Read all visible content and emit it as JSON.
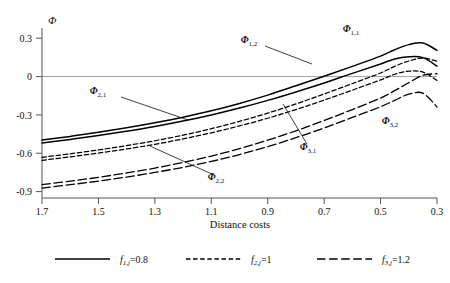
{
  "chart_data": {
    "type": "line",
    "title": "",
    "xlabel": "Distance costs",
    "ylabel": "Φ",
    "xlim": [
      1.7,
      0.3
    ],
    "ylim": [
      -0.95,
      0.38
    ],
    "x_reversed": true,
    "grid": false,
    "zero_line": true,
    "xticks": [
      "1.7",
      "1.5",
      "1.3",
      "1.1",
      "0.9",
      "0.7",
      "0.5",
      "0.3"
    ],
    "xtick_values": [
      1.7,
      1.5,
      1.3,
      1.1,
      0.9,
      0.7,
      0.5,
      0.3
    ],
    "yticks": [
      "0.3",
      "0",
      "-0.3",
      "-0.6",
      "-0.9"
    ],
    "ytick_values": [
      0.3,
      0,
      -0.3,
      -0.6,
      -0.9
    ],
    "legend_position": "below",
    "x": [
      1.7,
      1.6,
      1.5,
      1.4,
      1.3,
      1.2,
      1.1,
      1.0,
      0.9,
      0.8,
      0.7,
      0.6,
      0.5,
      0.45,
      0.4,
      0.35,
      0.3
    ],
    "series": [
      {
        "name": "Φ 1,1",
        "label": "Φ",
        "sub": "1,1",
        "style": "solid",
        "group": "f1j",
        "values": [
          -0.497,
          -0.468,
          -0.436,
          -0.401,
          -0.362,
          -0.318,
          -0.268,
          -0.21,
          -0.145,
          -0.072,
          0.003,
          0.08,
          0.16,
          0.21,
          0.25,
          0.262,
          0.205
        ]
      },
      {
        "name": "Φ 1,2",
        "label": "Φ",
        "sub": "1,2",
        "style": "solid",
        "group": "f1j",
        "values": [
          -0.52,
          -0.492,
          -0.461,
          -0.427,
          -0.39,
          -0.348,
          -0.3,
          -0.246,
          -0.186,
          -0.12,
          -0.05,
          0.025,
          0.098,
          0.138,
          0.155,
          0.148,
          0.082
        ]
      },
      {
        "name": "Φ 2,1",
        "label": "Φ",
        "sub": "2,1",
        "style": "short-dash",
        "group": "f2j",
        "values": [
          -0.632,
          -0.604,
          -0.574,
          -0.54,
          -0.502,
          -0.458,
          -0.408,
          -0.35,
          -0.286,
          -0.214,
          -0.136,
          -0.055,
          0.028,
          0.08,
          0.122,
          0.145,
          0.12
        ]
      },
      {
        "name": "Φ 2,2",
        "label": "Φ",
        "sub": "2,2",
        "style": "short-dash",
        "group": "f2j",
        "values": [
          -0.655,
          -0.628,
          -0.598,
          -0.566,
          -0.53,
          -0.488,
          -0.44,
          -0.386,
          -0.326,
          -0.258,
          -0.184,
          -0.106,
          -0.026,
          0.018,
          0.042,
          0.035,
          -0.03
        ]
      },
      {
        "name": "Φ 3,1",
        "label": "Φ",
        "sub": "3,1",
        "style": "long-dash",
        "group": "f3j",
        "values": [
          -0.845,
          -0.818,
          -0.788,
          -0.754,
          -0.716,
          -0.672,
          -0.622,
          -0.564,
          -0.498,
          -0.424,
          -0.344,
          -0.258,
          -0.168,
          -0.11,
          -0.048,
          0.01,
          0.022
        ]
      },
      {
        "name": "Φ 3,2",
        "label": "Φ",
        "sub": "3,2",
        "style": "long-dash",
        "group": "f3j",
        "values": [
          -0.872,
          -0.846,
          -0.818,
          -0.786,
          -0.75,
          -0.71,
          -0.664,
          -0.61,
          -0.548,
          -0.478,
          -0.402,
          -0.32,
          -0.236,
          -0.186,
          -0.138,
          -0.13,
          -0.238
        ]
      }
    ],
    "annotations": [
      {
        "id": "ann-phi-1-1",
        "text": "Φ",
        "sub": "1,1",
        "x": 351,
        "y": 32,
        "leader": null
      },
      {
        "id": "ann-phi-1-2",
        "text": "Φ",
        "sub": "1,2",
        "x": 249,
        "y": 43,
        "leader": [
          265,
          46,
          312,
          64
        ]
      },
      {
        "id": "ann-phi-2-1",
        "text": "Φ",
        "sub": "2,1",
        "x": 98,
        "y": 94,
        "leader": [
          121,
          97,
          188,
          120
        ]
      },
      {
        "id": "ann-phi-2-2",
        "text": "Φ",
        "sub": "2,2",
        "x": 216,
        "y": 180,
        "leader": [
          150,
          146,
          214,
          175
        ]
      },
      {
        "id": "ann-phi-3-1",
        "text": "Φ",
        "sub": "3,1",
        "x": 308,
        "y": 150,
        "leader": [
          283,
          104,
          307,
          144
        ]
      },
      {
        "id": "ann-phi-3-2",
        "text": "Φ",
        "sub": "3,2",
        "x": 390,
        "y": 124,
        "leader": null
      }
    ],
    "legend": [
      {
        "id": "legend-f1j",
        "symbol": "f",
        "sub": "1,j",
        "eq": "=0.8",
        "style": "solid",
        "text": "f1,j=0.8"
      },
      {
        "id": "legend-f2j",
        "symbol": "f",
        "sub": "2,j",
        "eq": "=1",
        "style": "short-dash",
        "text": "f2,j=1"
      },
      {
        "id": "legend-f3j",
        "symbol": "f",
        "sub": "3,j",
        "eq": "=1.2",
        "style": "long-dash",
        "text": "f3,j=1.2"
      }
    ]
  },
  "axis": {
    "y_symbol": "Φ",
    "x_title": "Distance costs"
  },
  "colors": {
    "curve": "#000000",
    "axis": "#555555",
    "zero": "#888888",
    "text": "#111111",
    "background": "#ffffff"
  }
}
